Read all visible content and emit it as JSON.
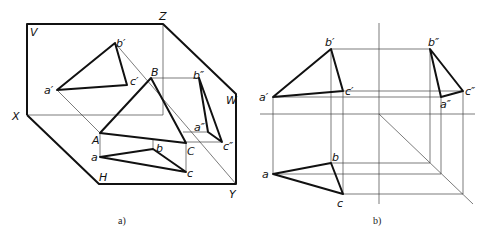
{
  "figure_a": {
    "caption": "a)",
    "planes": {
      "V": "V",
      "H": "H",
      "W": "W"
    },
    "axes": {
      "X": "X",
      "Y": "Y",
      "Z": "Z"
    },
    "points": {
      "A": "A",
      "B": "B",
      "C": "C",
      "a_front": "a′",
      "b_front": "b′",
      "c_front": "c′",
      "a_top": "a",
      "b_top": "b",
      "c_top": "c",
      "a_side": "a″",
      "b_side": "b″",
      "c_side": "c″"
    }
  },
  "figure_b": {
    "caption": "b)",
    "points": {
      "a_front": "a′",
      "b_front": "b′",
      "c_front": "c′",
      "a_top": "a",
      "b_top": "b",
      "c_top": "c",
      "a_side": "a″",
      "b_side": "b″",
      "c_side": "c″"
    }
  }
}
